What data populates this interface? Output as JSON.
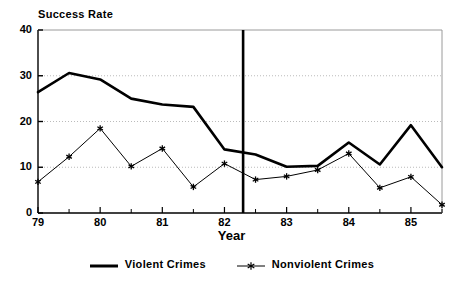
{
  "chart_data": {
    "type": "line",
    "title": "",
    "xlabel": "Year",
    "ylabel": "Success Rate",
    "ylim": [
      0,
      40
    ],
    "xlim": [
      79,
      85.5
    ],
    "yticks": [
      0,
      10,
      20,
      30,
      40
    ],
    "xticks": [
      79,
      80,
      81,
      82,
      83,
      84,
      85
    ],
    "xtick_labels": [
      "79",
      "80",
      "81",
      "82",
      "83",
      "84",
      "85"
    ],
    "ytick_labels": [
      "0",
      "10",
      "20",
      "30",
      "40"
    ],
    "minor_xticks": [
      79.5,
      80.5,
      81.5,
      82.5,
      83.5,
      84.5,
      85.5
    ],
    "grid": "horizontal-dotted",
    "legend_position": "below",
    "x": [
      79,
      79.5,
      80,
      80.5,
      81,
      81.5,
      82,
      82.5,
      83,
      83.5,
      84,
      84.5,
      85,
      85.5
    ],
    "series": [
      {
        "name": "Violent Crimes",
        "marker": "none",
        "line_style": "thick-solid",
        "color": "#000000",
        "values": [
          26.4,
          30.6,
          29.2,
          25.0,
          23.7,
          23.2,
          13.9,
          12.8,
          10.1,
          10.3,
          15.4,
          10.6,
          19.2,
          10.0
        ]
      },
      {
        "name": "Nonviolent Crimes",
        "marker": "asterisk",
        "line_style": "thin-solid",
        "color": "#000000",
        "values": [
          6.8,
          12.3,
          18.5,
          10.2,
          14.1,
          5.7,
          10.8,
          7.3,
          8.0,
          9.4,
          13.0,
          5.5,
          7.9,
          1.8
        ]
      }
    ],
    "annotations": [
      {
        "type": "vertical-line",
        "name": "intervention-line",
        "x": 82.3,
        "label": ""
      }
    ]
  },
  "legend": {
    "entries": [
      {
        "label": "Violent Crimes"
      },
      {
        "label": "Nonviolent Crimes"
      }
    ]
  },
  "colors": {
    "series_line": "#000000",
    "grid": "#bbbbbb",
    "axis": "#000000",
    "background": "#ffffff"
  }
}
